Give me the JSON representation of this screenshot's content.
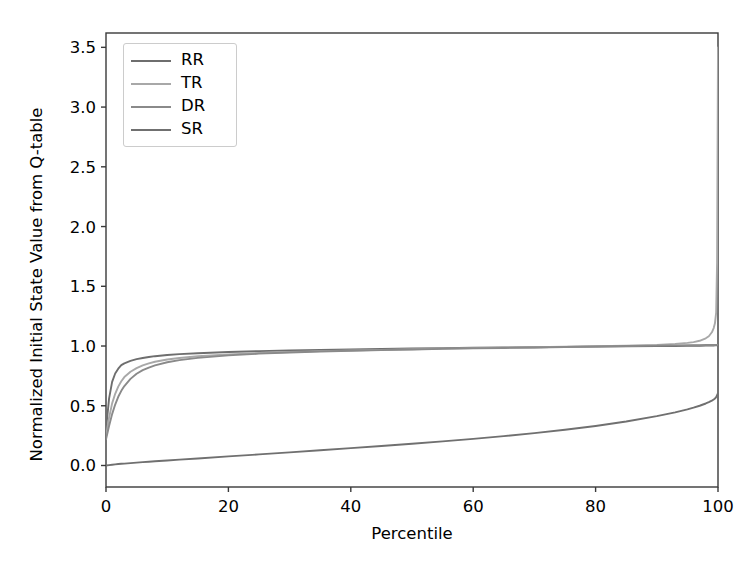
{
  "chart_data": {
    "type": "line",
    "title": "",
    "xlabel": "Percentile",
    "ylabel": "Normalized Initial State Value from Q-table",
    "xlim": [
      0,
      100
    ],
    "ylim": [
      -0.18,
      3.62
    ],
    "xticks": [
      0,
      20,
      40,
      60,
      80,
      100
    ],
    "xticklabels": [
      "0",
      "20",
      "40",
      "60",
      "80",
      "100"
    ],
    "yticks": [
      0.0,
      0.5,
      1.0,
      1.5,
      2.0,
      2.5,
      3.0,
      3.5
    ],
    "yticklabels": [
      "0.0",
      "0.5",
      "1.0",
      "1.5",
      "2.0",
      "2.5",
      "3.0",
      "3.5"
    ],
    "grid": false,
    "legend_position": "upper left",
    "x": [
      0,
      0.5,
      1,
      1.5,
      2,
      2.5,
      3,
      4,
      5,
      6,
      7,
      8,
      10,
      12,
      15,
      20,
      25,
      30,
      35,
      40,
      45,
      50,
      55,
      60,
      65,
      70,
      75,
      80,
      85,
      90,
      93,
      95,
      96,
      97,
      98,
      98.5,
      99,
      99.3,
      99.5,
      99.7,
      99.85,
      100
    ],
    "series": [
      {
        "name": "RR",
        "color": "#6e6e6e",
        "values": [
          0.3,
          0.56,
          0.7,
          0.77,
          0.81,
          0.84,
          0.855,
          0.875,
          0.89,
          0.9,
          0.908,
          0.915,
          0.925,
          0.932,
          0.94,
          0.95,
          0.957,
          0.963,
          0.968,
          0.972,
          0.976,
          0.979,
          0.982,
          0.985,
          0.988,
          0.99,
          0.993,
          0.995,
          0.997,
          0.999,
          1.0,
          1.001,
          1.002,
          1.002,
          1.003,
          1.003,
          1.004,
          1.004,
          1.005,
          1.005,
          1.006,
          1.007
        ]
      },
      {
        "name": "TR",
        "color": "#a8a8a8",
        "values": [
          0.24,
          0.4,
          0.52,
          0.6,
          0.66,
          0.705,
          0.74,
          0.785,
          0.815,
          0.838,
          0.855,
          0.868,
          0.887,
          0.9,
          0.914,
          0.93,
          0.941,
          0.95,
          0.957,
          0.963,
          0.968,
          0.973,
          0.978,
          0.982,
          0.986,
          0.99,
          0.994,
          0.998,
          1.003,
          1.01,
          1.018,
          1.026,
          1.033,
          1.044,
          1.065,
          1.082,
          1.115,
          1.15,
          1.19,
          1.28,
          1.7,
          3.5
        ]
      },
      {
        "name": "DR",
        "color": "#8a8a8a",
        "values": [
          0.22,
          0.33,
          0.43,
          0.51,
          0.575,
          0.625,
          0.665,
          0.725,
          0.768,
          0.798,
          0.82,
          0.838,
          0.864,
          0.882,
          0.901,
          0.922,
          0.936,
          0.946,
          0.954,
          0.961,
          0.966,
          0.971,
          0.976,
          0.98,
          0.984,
          0.988,
          0.992,
          0.996,
          1.0,
          1.003,
          1.005,
          1.006,
          1.007,
          1.007,
          1.008,
          1.008,
          1.009,
          1.009,
          1.009,
          1.01,
          1.01,
          1.01
        ]
      },
      {
        "name": "SR",
        "color": "#707070",
        "values": [
          0.0,
          0.003,
          0.006,
          0.009,
          0.012,
          0.014,
          0.016,
          0.02,
          0.024,
          0.028,
          0.031,
          0.035,
          0.042,
          0.049,
          0.059,
          0.076,
          0.093,
          0.11,
          0.127,
          0.145,
          0.163,
          0.182,
          0.202,
          0.223,
          0.246,
          0.271,
          0.299,
          0.331,
          0.368,
          0.413,
          0.445,
          0.47,
          0.484,
          0.5,
          0.519,
          0.53,
          0.543,
          0.552,
          0.56,
          0.572,
          0.588,
          0.605
        ]
      }
    ]
  },
  "legend": {
    "entries": [
      {
        "label": "RR"
      },
      {
        "label": "TR"
      },
      {
        "label": "DR"
      },
      {
        "label": "SR"
      }
    ]
  },
  "axes": {
    "frame_color": "#3a3a3a",
    "tick_color": "#3a3a3a",
    "text_color": "#000000"
  }
}
